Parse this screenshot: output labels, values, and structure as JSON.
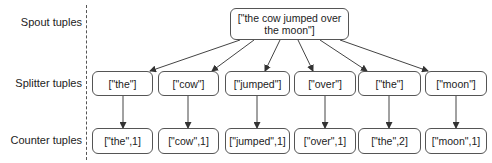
{
  "row_labels": {
    "spout": "Spout tuples",
    "splitter": "Splitter tuples",
    "counter": "Counter tuples"
  },
  "spout": {
    "line1": "[\"the cow jumped over",
    "line2": "the moon\"]"
  },
  "splitter": [
    {
      "label": "[\"the\"]"
    },
    {
      "label": "[\"cow\"]"
    },
    {
      "label": "[\"jumped\"]"
    },
    {
      "label": "[\"over\"]"
    },
    {
      "label": "[\"the\"]"
    },
    {
      "label": "[\"moon\"]"
    }
  ],
  "counter": [
    {
      "label": "[\"the\",1]"
    },
    {
      "label": "[\"cow\",1]"
    },
    {
      "label": "[\"jumped\",1]"
    },
    {
      "label": "[\"over\",1]"
    },
    {
      "label": "[\"the\",2]"
    },
    {
      "label": "[\"moon\",1]"
    }
  ]
}
